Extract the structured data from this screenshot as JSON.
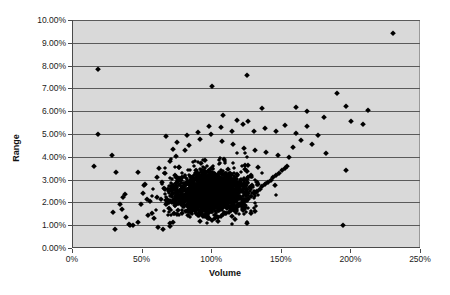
{
  "chart": {
    "type": "scatter",
    "background": "#d9d9d9",
    "gridline_color": "#5a5a5a",
    "marker_color": "#000000",
    "marker_shape": "diamond"
  },
  "axes": {
    "x_title": "Volume",
    "y_title": "Range",
    "x_ticks": [
      "0%",
      "50%",
      "100%",
      "150%",
      "200%",
      "250%"
    ],
    "y_ticks": [
      "0.00%",
      "1.00%",
      "2.00%",
      "3.00%",
      "4.00%",
      "5.00%",
      "6.00%",
      "7.00%",
      "8.00%",
      "9.00%",
      "10.00%"
    ]
  },
  "chart_data": {
    "type": "scatter",
    "title": "",
    "xlabel": "Volume",
    "ylabel": "Range",
    "xlim": [
      0,
      250
    ],
    "ylim": [
      0,
      10
    ],
    "xticks": [
      0,
      50,
      100,
      150,
      200,
      250
    ],
    "yticks": [
      0,
      1,
      2,
      3,
      4,
      5,
      6,
      7,
      8,
      9,
      10
    ],
    "x_unit": "%",
    "y_unit": "%",
    "grid": "horizontal",
    "legend": "none",
    "series": [
      {
        "name": "Volume vs Range",
        "marker": "diamond",
        "color": "#000000",
        "points": [
          [
            18,
            7.85
          ],
          [
            18,
            5.0
          ],
          [
            15,
            3.6
          ],
          [
            28,
            4.1
          ],
          [
            31,
            3.35
          ],
          [
            29,
            1.6
          ],
          [
            30,
            0.85
          ],
          [
            36,
            2.25
          ],
          [
            37,
            2.35
          ],
          [
            34,
            1.95
          ],
          [
            35,
            1.7
          ],
          [
            38,
            1.35
          ],
          [
            41,
            1.0
          ],
          [
            43,
            1.0
          ],
          [
            40,
            1.05
          ],
          [
            47,
            1.15
          ],
          [
            52,
            2.8
          ],
          [
            50,
            2.4
          ],
          [
            53,
            2.15
          ],
          [
            49,
            1.95
          ],
          [
            55,
            2.05
          ],
          [
            57,
            1.55
          ],
          [
            54,
            1.45
          ],
          [
            58,
            1.3
          ],
          [
            61,
            0.9
          ],
          [
            65,
            0.85
          ],
          [
            70,
            0.95
          ],
          [
            72,
            1.15
          ],
          [
            60,
            3.1
          ],
          [
            62,
            3.5
          ],
          [
            64,
            2.9
          ],
          [
            66,
            3.3
          ],
          [
            68,
            2.6
          ],
          [
            70,
            3.8
          ],
          [
            72,
            4.35
          ],
          [
            74,
            4.05
          ],
          [
            76,
            3.55
          ],
          [
            78,
            3.1
          ],
          [
            80,
            2.7
          ],
          [
            82,
            2.4
          ],
          [
            84,
            2.2
          ],
          [
            86,
            2.0
          ],
          [
            88,
            1.85
          ],
          [
            90,
            1.7
          ],
          [
            92,
            1.55
          ],
          [
            94,
            1.45
          ],
          [
            96,
            1.35
          ],
          [
            98,
            1.3
          ],
          [
            100,
            1.25
          ],
          [
            102,
            1.3
          ],
          [
            104,
            1.35
          ],
          [
            106,
            1.4
          ],
          [
            108,
            1.5
          ],
          [
            110,
            1.55
          ],
          [
            112,
            1.6
          ],
          [
            114,
            1.7
          ],
          [
            116,
            1.75
          ],
          [
            118,
            1.8
          ],
          [
            120,
            1.9
          ],
          [
            122,
            2.0
          ],
          [
            124,
            2.1
          ],
          [
            126,
            2.2
          ],
          [
            128,
            2.3
          ],
          [
            130,
            2.4
          ],
          [
            132,
            2.5
          ],
          [
            134,
            2.6
          ],
          [
            136,
            2.7
          ],
          [
            138,
            2.8
          ],
          [
            140,
            2.9
          ],
          [
            142,
            3.0
          ],
          [
            144,
            3.1
          ],
          [
            146,
            3.2
          ],
          [
            148,
            3.3
          ],
          [
            150,
            3.4
          ],
          [
            152,
            3.5
          ],
          [
            154,
            3.6
          ],
          [
            67,
            4.9
          ],
          [
            75,
            4.65
          ],
          [
            83,
            4.5
          ],
          [
            91,
            4.8
          ],
          [
            99,
            5.0
          ],
          [
            107,
            4.7
          ],
          [
            115,
            4.55
          ],
          [
            123,
            4.4
          ],
          [
            131,
            4.3
          ],
          [
            139,
            4.2
          ],
          [
            147,
            4.1
          ],
          [
            155,
            4.0
          ],
          [
            100,
            7.1
          ],
          [
            125,
            7.6
          ],
          [
            108,
            5.85
          ],
          [
            118,
            5.6
          ],
          [
            126,
            5.55
          ],
          [
            136,
            6.15
          ],
          [
            152,
            5.4
          ],
          [
            160,
            5.05
          ],
          [
            168,
            5.35
          ],
          [
            176,
            4.95
          ],
          [
            160,
            6.2
          ],
          [
            168,
            6.0
          ],
          [
            180,
            5.75
          ],
          [
            190,
            6.8
          ],
          [
            196,
            6.25
          ],
          [
            200,
            5.55
          ],
          [
            208,
            5.45
          ],
          [
            212,
            6.05
          ],
          [
            196,
            3.4
          ],
          [
            194,
            1.0
          ],
          [
            230,
            9.45
          ],
          [
            182,
            4.15
          ],
          [
            172,
            4.55
          ],
          [
            164,
            4.75
          ],
          [
            158,
            4.45
          ],
          [
            146,
            5.15
          ],
          [
            138,
            5.25
          ],
          [
            130,
            5.15
          ],
          [
            122,
            5.45
          ],
          [
            114,
            5.15
          ],
          [
            106,
            5.3
          ],
          [
            98,
            5.35
          ],
          [
            90,
            5.1
          ],
          [
            82,
            4.95
          ]
        ]
      }
    ]
  }
}
